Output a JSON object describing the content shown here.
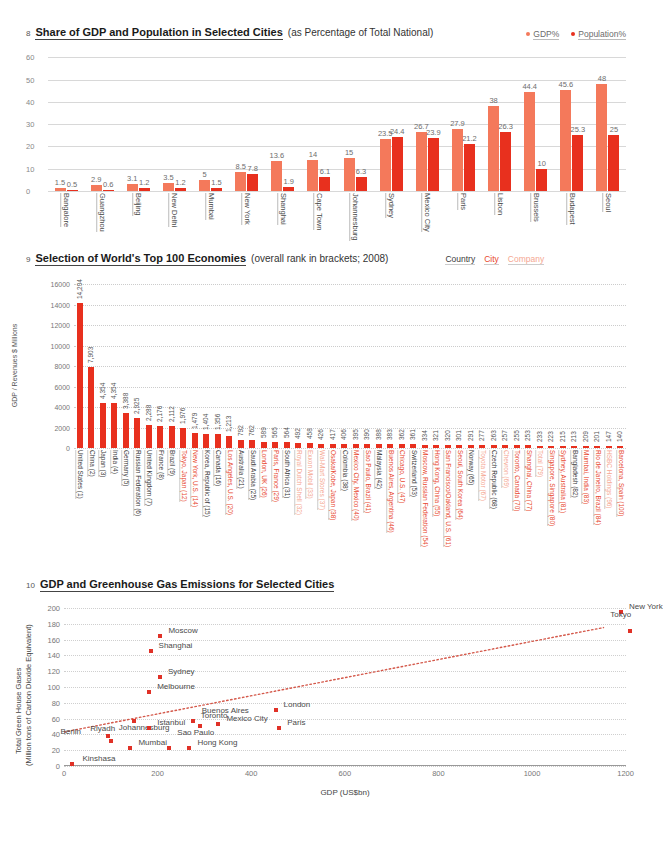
{
  "chart8": {
    "number": "8",
    "title": "Share of GDP and Population in Selected Cities",
    "subtitle": "(as Percentage of Total National)",
    "legend": [
      {
        "label": "GDP%",
        "color": "#f4795b"
      },
      {
        "label": "Population%",
        "color": "#e8301e"
      }
    ],
    "chart_data": {
      "type": "bar",
      "title": "Share of GDP and Population in Selected Cities",
      "xlabel": "",
      "ylabel": "",
      "ylim": [
        0,
        62
      ],
      "yticks": [
        0,
        10,
        20,
        30,
        40,
        50,
        60
      ],
      "grid": true,
      "categories": [
        "Bangalore",
        "Guangzhou",
        "Beijing",
        "New Delhi",
        "Mumbai",
        "New York",
        "Shanghai",
        "Cape Town",
        "Johannesburg",
        "Sydney",
        "Mexico City",
        "Paris",
        "Lisbon",
        "Brussels",
        "Budapest",
        "Seoul"
      ],
      "series": [
        {
          "name": "GDP%",
          "color": "#f4795b",
          "values": [
            1.5,
            2.9,
            3.1,
            3.5,
            5,
            8.5,
            13.6,
            14,
            15,
            23.5,
            26.7,
            27.9,
            38,
            44.4,
            45.6,
            48
          ]
        },
        {
          "name": "Population%",
          "color": "#e8301e",
          "values": [
            0.5,
            0.6,
            1.2,
            1.2,
            1.5,
            7.8,
            1.9,
            6.1,
            6.3,
            24.4,
            23.9,
            21.2,
            26.3,
            10,
            25.3,
            25
          ]
        }
      ]
    }
  },
  "chart9": {
    "number": "9",
    "title": "Selection of World's Top 100 Economies",
    "subtitle": "(overall rank in brackets; 2008)",
    "legend": [
      {
        "label": "Country",
        "color": "#3a3a3a"
      },
      {
        "label": "City",
        "color": "#e8472e"
      },
      {
        "label": "Company",
        "color": "#f5a792"
      }
    ],
    "yaxis_title": "GDP / Revenues $ Millions",
    "chart_data": {
      "type": "bar",
      "title": "Selection of World's Top 100 Economies",
      "xlabel": "",
      "ylabel": "GDP / Revenues $ Millions",
      "ylim": [
        0,
        16800
      ],
      "yticks": [
        0,
        2000,
        4000,
        6000,
        8000,
        10000,
        12000,
        14000,
        16000
      ],
      "grid": true,
      "categories": [
        "United States (1)",
        "China (2)",
        "Japan (3)",
        "India (4)",
        "Germany (5)",
        "Russian Federation (6)",
        "United Kingdom (7)",
        "France (8)",
        "Brazil (9)",
        "Tokyo, Japan (12)",
        "New York, U.S. (14)",
        "Korea, Republic of (15)",
        "Canada (16)",
        "Los Angeles, U.S. (20)",
        "Australia (21)",
        "Saudi Arabia (25)",
        "London, UK (26)",
        "Paris, France (29)",
        "South Africa (31)",
        "Royal Dutch Shell (32)",
        "Exxon Mobil (33)",
        "Wal-Mart Stores (37)",
        "Osaka/Kobe, Japan (38)",
        "Colombia (38)",
        "Mexico City, Mexico (40)",
        "Sao Paulo, Brazil (41)",
        "Malaysia (42)",
        "Buenos Aires, Argentina (46)",
        "Chicago, U.S. (47)",
        "Switzerland (53)",
        "Moscow, Russian Federation (54)",
        "Hong Kong, China (55)",
        "San Francisco/Oakland, U.S. (61)",
        "Seoul, South Korea (64)",
        "Norway (65)",
        "Toyota Motor (67)",
        "Czech Republic (68)",
        "Chevron (69)",
        "Toronto, Canada (70)",
        "Shanghai, China (77)",
        "Total (79)",
        "Singapore, Singapore (80)",
        "Sydney, Australia (81)",
        "Bangladesh (82)",
        "Mumbai, India (83)",
        "Rio de Janeiro, Brazil (84)",
        "HSBC Holdings (96)",
        "Barcelona, Spain (100)"
      ],
      "label_types": [
        "country",
        "country",
        "country",
        "country",
        "country",
        "country",
        "country",
        "country",
        "country",
        "city",
        "city",
        "country",
        "country",
        "city",
        "country",
        "country",
        "city",
        "city",
        "country",
        "company",
        "company",
        "company",
        "city",
        "country",
        "city",
        "city",
        "country",
        "city",
        "city",
        "country",
        "city",
        "city",
        "city",
        "city",
        "country",
        "company",
        "country",
        "company",
        "city",
        "city",
        "company",
        "city",
        "city",
        "country",
        "city",
        "city",
        "company",
        "city"
      ],
      "values": [
        14204,
        7903,
        4354,
        4354,
        3388,
        2925,
        2288,
        2176,
        2112,
        1976,
        1479,
        1404,
        1356,
        1213,
        792,
        762,
        589,
        565,
        564,
        492,
        458,
        426,
        417,
        406,
        395,
        390,
        388,
        383,
        362,
        361,
        334,
        321,
        320,
        301,
        291,
        277,
        263,
        257,
        255,
        253,
        233,
        223,
        215,
        213,
        209,
        201,
        147,
        140
      ],
      "value_labels": [
        "14,204",
        "7,903",
        "4,354",
        "4,354",
        "3,388",
        "2,925",
        "2,288",
        "2,176",
        "2,112",
        "1,976",
        "1,479",
        "1,404",
        "1,356",
        "1,213",
        "792",
        "762",
        "589",
        "565",
        "564",
        "492",
        "458",
        "426",
        "417",
        "406",
        "395",
        "390",
        "388",
        "383",
        "362",
        "361",
        "334",
        "321",
        "320",
        "301",
        "291",
        "277",
        "263",
        "257",
        "255",
        "253",
        "233",
        "223",
        "215",
        "213",
        "209",
        "201",
        "147",
        "140"
      ],
      "colors": {
        "country": "#3a3a3a",
        "city": "#e8472e",
        "company": "#f5a792",
        "bar": "#e8301e"
      }
    }
  },
  "chart10": {
    "number": "10",
    "title": "GDP and Greenhouse Gas Emissions for Selected Cities",
    "yaxis_title_line1": "Total Green House Gases",
    "yaxis_title_line2": "(Million tons of Carbon Dioxide Equivalent)",
    "xaxis_title": "GDP (US$bn)",
    "chart_data": {
      "type": "scatter",
      "title": "GDP and Greenhouse Gas Emissions for Selected Cities",
      "xlabel": "GDP (US$bn)",
      "ylabel": "Total Green House Gases (Million tons of Carbon Dioxide Equivalent)",
      "xlim": [
        0,
        1250
      ],
      "ylim": [
        0,
        205
      ],
      "xticks": [
        0,
        200,
        400,
        600,
        800,
        1000,
        1200
      ],
      "yticks": [
        0,
        20,
        40,
        60,
        80,
        100,
        120,
        140,
        160,
        180,
        200
      ],
      "grid": true,
      "point_color": "#e03127",
      "trendline": {
        "style": "dotted",
        "color": "#d4584a",
        "x0": 0,
        "y0": 42,
        "x1": 1200,
        "y1": 175
      },
      "points": [
        {
          "label": "Kinshasa",
          "x": 18,
          "y": 5,
          "lx": 10,
          "ly": -3
        },
        {
          "label": "Berlin",
          "x": 95,
          "y": 40,
          "lx": -48,
          "ly": -2
        },
        {
          "label": "Johannesburg",
          "x": 100,
          "y": 34,
          "lx": 8,
          "ly": -11
        },
        {
          "label": "Mumbai",
          "x": 142,
          "y": 25,
          "lx": 8,
          "ly": -3
        },
        {
          "label": "Riyadh",
          "x": 150,
          "y": 59,
          "lx": -44,
          "ly": 10
        },
        {
          "label": "Sao Paulo",
          "x": 225,
          "y": 25,
          "lx": 8,
          "ly": -13
        },
        {
          "label": "Istanbul",
          "x": 182,
          "y": 51,
          "lx": 8,
          "ly": -3
        },
        {
          "label": "Hong Kong",
          "x": 268,
          "y": 25,
          "lx": 8,
          "ly": -3
        },
        {
          "label": "Shanghai",
          "x": 185,
          "y": 148,
          "lx": 8,
          "ly": -3
        },
        {
          "label": "Moscow",
          "x": 206,
          "y": 167,
          "lx": 8,
          "ly": -3
        },
        {
          "label": "Melbourne",
          "x": 182,
          "y": 96,
          "lx": 8,
          "ly": -3
        },
        {
          "label": "Sydney",
          "x": 205,
          "y": 115,
          "lx": 8,
          "ly": -3
        },
        {
          "label": "Buenos Aires",
          "x": 290,
          "y": 53,
          "lx": 2,
          "ly": -13
        },
        {
          "label": "Toronto",
          "x": 275,
          "y": 60,
          "lx": 8,
          "ly": -3
        },
        {
          "label": "Mexico City",
          "x": 330,
          "y": 56,
          "lx": 8,
          "ly": -3
        },
        {
          "label": "London",
          "x": 452,
          "y": 73,
          "lx": 8,
          "ly": -3
        },
        {
          "label": "Paris",
          "x": 460,
          "y": 50,
          "lx": 8,
          "ly": -3
        },
        {
          "label": "New York",
          "x": 1190,
          "y": 197,
          "lx": 8,
          "ly": -3
        },
        {
          "label": "Tokyo",
          "x": 1210,
          "y": 173,
          "lx": -20,
          "ly": -14
        }
      ]
    }
  }
}
